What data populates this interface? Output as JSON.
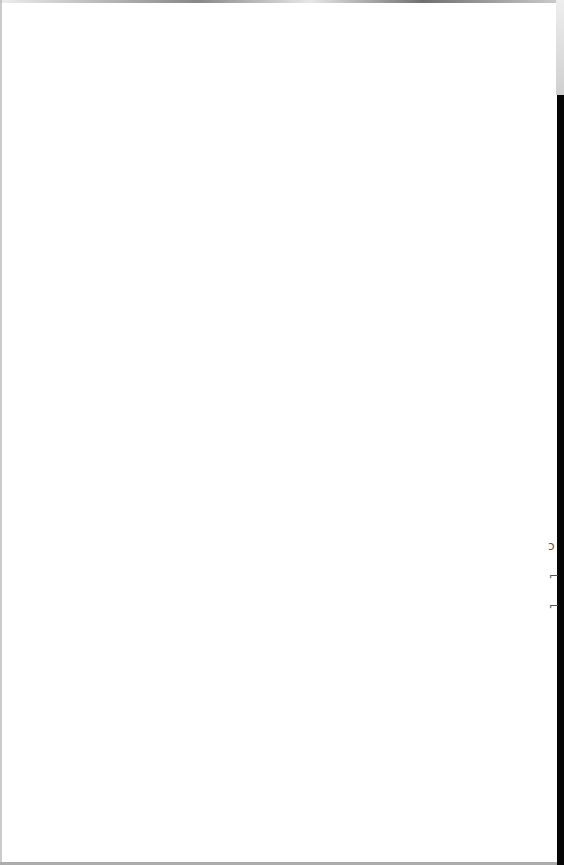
{
  "document": {
    "type": "scanned-page",
    "content": "",
    "margin_marks": [
      {
        "glyph": "ↄ",
        "top": 540
      },
      {
        "glyph": "⌐",
        "top": 570
      },
      {
        "glyph": "⌐",
        "top": 600
      }
    ]
  },
  "colors": {
    "paper": "#ffffff",
    "edge_strip": "#050505"
  }
}
